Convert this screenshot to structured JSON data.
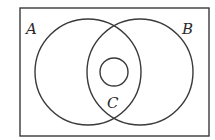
{
  "diagram": {
    "type": "venn",
    "universe": {
      "x": 20,
      "y": 8,
      "width": 189,
      "height": 128
    },
    "sets": [
      {
        "name": "A",
        "label": "A",
        "cx": 88,
        "cy": 72,
        "r": 53,
        "label_x": 26,
        "label_y": 34
      },
      {
        "name": "B",
        "label": "B",
        "cx": 140,
        "cy": 72,
        "r": 53,
        "label_x": 182,
        "label_y": 34
      },
      {
        "name": "C",
        "label": "C",
        "cx": 114,
        "cy": 72,
        "r": 14,
        "label_x": 107,
        "label_y": 108
      }
    ],
    "colors": {
      "stroke": "#3a3a3a",
      "text": "#2a2a2a",
      "background": "#ffffff"
    }
  }
}
